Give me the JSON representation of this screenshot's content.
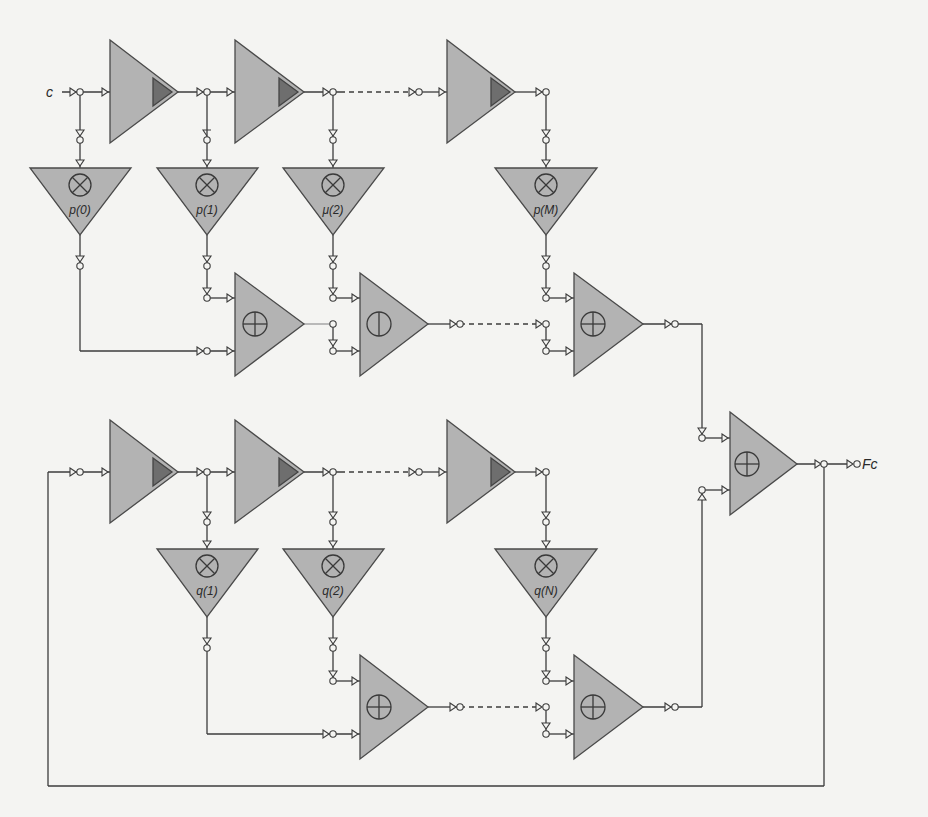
{
  "colors": {
    "background": "#f4f4f2",
    "block_fill": "#b3b3b3",
    "block_stroke": "#4a4a4a",
    "delay_inner_fill": "#6e6e6e",
    "wire": "#3c3c3c"
  },
  "input": {
    "label": "c"
  },
  "output": {
    "label": "Fc"
  },
  "feedforward": {
    "delays": [
      {
        "id": "d-top-1",
        "kind": "delay"
      },
      {
        "id": "d-top-2",
        "kind": "delay"
      },
      {
        "id": "d-top-M",
        "kind": "delay"
      }
    ],
    "multipliers": [
      {
        "id": "mul-p0",
        "label": "p(0)"
      },
      {
        "id": "mul-p1",
        "label": "p(1)"
      },
      {
        "id": "mul-p2",
        "label": "μ(2)"
      },
      {
        "id": "mul-pM",
        "label": "p(M)"
      }
    ],
    "adders": [
      {
        "id": "add-top-1",
        "symbol": "plus"
      },
      {
        "id": "add-top-2",
        "symbol": "minus"
      },
      {
        "id": "add-top-M",
        "symbol": "plus"
      }
    ]
  },
  "feedback": {
    "delays": [
      {
        "id": "d-bot-1",
        "kind": "delay"
      },
      {
        "id": "d-bot-2",
        "kind": "delay"
      },
      {
        "id": "d-bot-N",
        "kind": "delay"
      }
    ],
    "multipliers": [
      {
        "id": "mul-q1",
        "label": "q(1)"
      },
      {
        "id": "mul-q2",
        "label": "q(2)"
      },
      {
        "id": "mul-qN",
        "label": "q(N)"
      }
    ],
    "adders": [
      {
        "id": "add-bot-2",
        "symbol": "plus"
      },
      {
        "id": "add-bot-N",
        "symbol": "plus"
      }
    ]
  },
  "final_adder": {
    "id": "add-final",
    "symbol": "plus"
  },
  "symbols": {
    "multiply": "⊗",
    "add": "⊕",
    "subtract": "⦶"
  }
}
